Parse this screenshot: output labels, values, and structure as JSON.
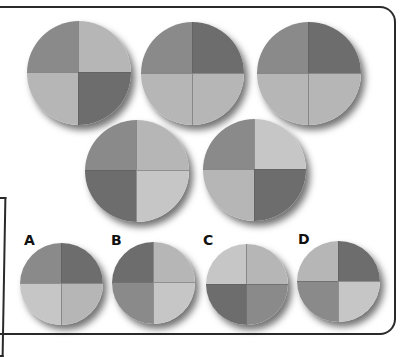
{
  "palette": {
    "dark": "#6d6d6d",
    "medium": "#8a8a8a",
    "light": "#b6b6b6",
    "lightest": "#c6c6c6"
  },
  "sequence": [
    {
      "id": "seq-1",
      "quadrants": {
        "tl": "medium",
        "tr": "light",
        "bl": "light",
        "br": "dark"
      }
    },
    {
      "id": "seq-2",
      "quadrants": {
        "tl": "medium",
        "tr": "dark",
        "bl": "light",
        "br": "light"
      }
    },
    {
      "id": "seq-3",
      "quadrants": {
        "tl": "medium",
        "tr": "dark",
        "bl": "light",
        "br": "light"
      }
    },
    {
      "id": "seq-4",
      "quadrants": {
        "tl": "medium",
        "tr": "light",
        "bl": "dark",
        "br": "lightest"
      }
    },
    {
      "id": "seq-5",
      "quadrants": {
        "tl": "medium",
        "tr": "lightest",
        "bl": "light",
        "br": "dark"
      }
    }
  ],
  "options": [
    {
      "label": "A",
      "quadrants": {
        "tl": "medium",
        "tr": "dark",
        "bl": "lightest",
        "br": "light"
      }
    },
    {
      "label": "B",
      "quadrants": {
        "tl": "dark",
        "tr": "light",
        "bl": "medium",
        "br": "lightest"
      }
    },
    {
      "label": "C",
      "quadrants": {
        "tl": "lightest",
        "tr": "light",
        "bl": "dark",
        "br": "medium"
      }
    },
    {
      "label": "D",
      "quadrants": {
        "tl": "light",
        "tr": "dark",
        "bl": "medium",
        "br": "lightest"
      }
    }
  ]
}
